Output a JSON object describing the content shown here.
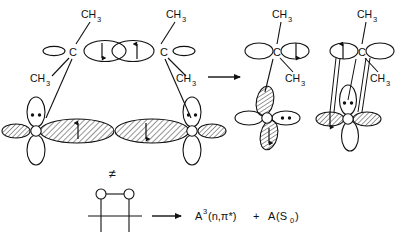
{
  "figure": {
    "width": 409,
    "height": 244,
    "stroke_color": "#111111",
    "background_color": "#ffffff",
    "hatch_color": "#111111"
  },
  "labels": {
    "methyl": "CH",
    "methyl_sub": "3",
    "carbon": "C",
    "oxygen": "O",
    "not_equal": "≠",
    "plus": "+"
  },
  "reactant_complex": {
    "name": "biradicaloid-transition-state",
    "left_carbon": {
      "atom": "C",
      "substituents": [
        "CH3",
        "CH3"
      ],
      "side_lobe": "empty-sp-lobe"
    },
    "right_carbon": {
      "atom": "C",
      "substituents": [
        "CH3",
        "CH3"
      ],
      "side_lobe": "empty-sp-lobe"
    },
    "central_pi_lobes": [
      {
        "spin": "down",
        "arrow": "↓"
      },
      {
        "spin": "up",
        "arrow": "↑"
      }
    ],
    "left_oxygen": {
      "atom": "O",
      "lone_pair_dots": 2,
      "sigma_lobe_spin": "up",
      "sigma_arrow": "↑"
    },
    "right_oxygen": {
      "atom": "O",
      "lone_pair_dots": 2,
      "sigma_lobe_spin": "down",
      "sigma_arrow": "↓"
    }
  },
  "product_triplet": {
    "name": "triplet-n-pi-star-acetone",
    "carbon": {
      "atom": "C",
      "substituents": [
        "CH3",
        "CH3"
      ],
      "lobe_spin": "down",
      "lobe_arrow": "↓"
    },
    "oxygen": {
      "atom": "O",
      "lone_pair_dots": 2,
      "upper_lobe": "hatched",
      "lower_lobe_spin": "down",
      "lower_lobe_arrow": "↓"
    }
  },
  "product_ground": {
    "name": "ground-state-singlet-acetone",
    "carbon": {
      "atom": "C",
      "substituents": [
        "CH3",
        "CH3"
      ],
      "lobe_spin": "up",
      "lobe_arrow": "↑"
    },
    "oxygen": {
      "atom": "O",
      "lone_pair_dots": 2,
      "left_lobe_spin": "down",
      "left_lobe_arrow": "↓"
    },
    "pi_bond": "double-line-overlap"
  },
  "bottom_equation": {
    "reactant_name": "tetramethyl-dioxetane",
    "ring_atoms": [
      "O",
      "O"
    ],
    "arrow": "→",
    "products": [
      {
        "formula_main": "A",
        "superscript": "3",
        "state": "(n,π*)"
      },
      {
        "formula_main": "A",
        "state": "(S",
        "sub": "0",
        "close": ")"
      }
    ],
    "plus": "+",
    "full_text": "A³(n,π*) + A(S₀)"
  }
}
